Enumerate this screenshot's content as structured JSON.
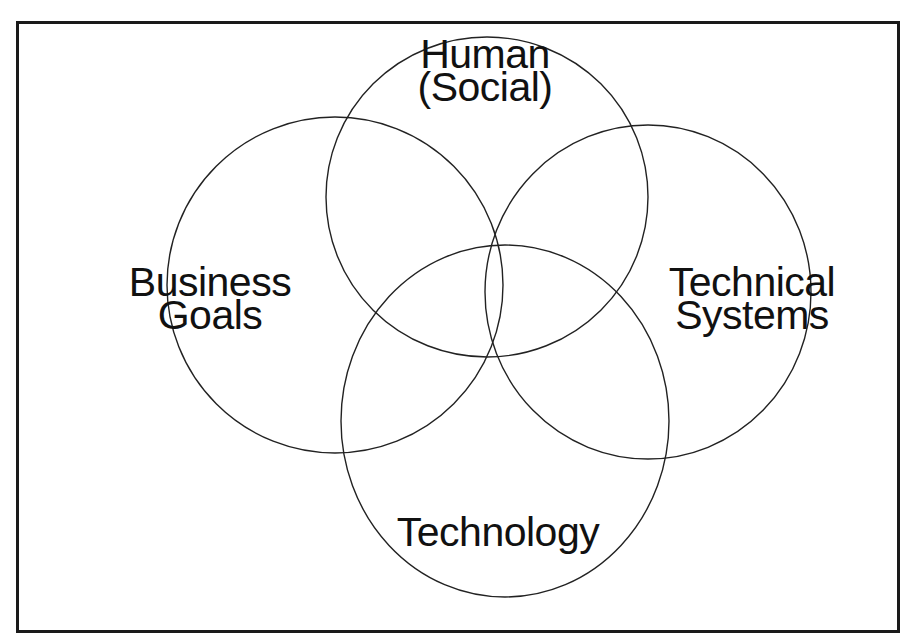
{
  "diagram": {
    "type": "venn",
    "sets": [
      {
        "id": "human",
        "lines": [
          "Human",
          "(Social)"
        ]
      },
      {
        "id": "business",
        "lines": [
          "Business",
          "Goals"
        ]
      },
      {
        "id": "technical",
        "lines": [
          "Technical",
          "Systems"
        ]
      },
      {
        "id": "technology",
        "lines": [
          "Technology"
        ]
      }
    ],
    "colors": {
      "stroke": "#222222",
      "text": "#111111",
      "background": "#ffffff",
      "frame": "#1a1a1a"
    }
  }
}
